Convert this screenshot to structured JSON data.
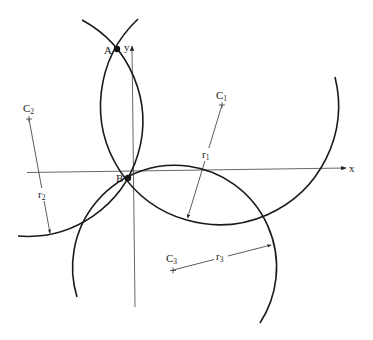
{
  "diagram": {
    "axes": {
      "x_label": "x",
      "y_label": "y"
    },
    "points": {
      "A": "A",
      "B": "B"
    },
    "centers": [
      {
        "name": "C",
        "sub": "1"
      },
      {
        "name": "C",
        "sub": "2"
      },
      {
        "name": "C",
        "sub": "3"
      }
    ],
    "radii": [
      {
        "name": "r",
        "sub": "1"
      },
      {
        "name": "r",
        "sub": "2"
      },
      {
        "name": "r",
        "sub": "3"
      }
    ],
    "colors": {
      "line": "#1a1a1a",
      "axis": "#555555",
      "background": "#ffffff"
    }
  }
}
